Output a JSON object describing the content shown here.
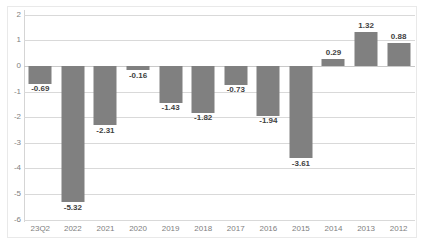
{
  "chart_data": {
    "type": "bar",
    "title": "",
    "subtitle": "",
    "xlabel": "",
    "ylabel": "",
    "categories": [
      "23Q2",
      "2022",
      "2021",
      "2020",
      "2019",
      "2018",
      "2017",
      "2016",
      "2015",
      "2014",
      "2013",
      "2012"
    ],
    "values": [
      -0.69,
      -5.32,
      -2.31,
      -0.16,
      -1.43,
      -1.82,
      -0.73,
      -1.94,
      -3.61,
      0.29,
      1.32,
      0.88
    ],
    "data_labels": [
      "-0.69",
      "-5.32",
      "-2.31",
      "-0.16",
      "-1.43",
      "-1.82",
      "-0.73",
      "-1.94",
      "-3.61",
      "0.29",
      "1.32",
      "0.88"
    ],
    "ylim": [
      -6,
      2
    ],
    "yticks": [
      2,
      1,
      0,
      -1,
      -2,
      -3,
      -4,
      -5,
      -6
    ],
    "ytick_labels": [
      "2",
      "1",
      "0",
      "-1",
      "-2",
      "-3",
      "-4",
      "-5",
      "-6"
    ],
    "grid": true,
    "legend": false,
    "legend_position": "none",
    "series": [
      {
        "name": "",
        "values": [
          -0.69,
          -5.32,
          -2.31,
          -0.16,
          -1.43,
          -1.82,
          -0.73,
          -1.94,
          -3.61,
          0.29,
          1.32,
          0.88
        ],
        "color": "#808080"
      }
    ],
    "colors": {
      "bar": "#808080",
      "gridline": "#d9d9d9",
      "zero_line": "#c9c9c9",
      "axis_text": "#808080",
      "label_text": "#3f3f3f",
      "background": "#ffffff",
      "frame": "#e9e9e9"
    }
  }
}
